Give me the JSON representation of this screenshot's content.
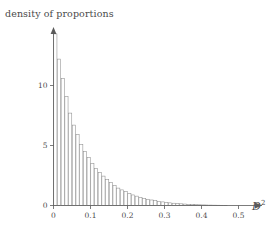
{
  "chart_data": {
    "type": "bar",
    "title": "density of proportions",
    "xlabel": "D²",
    "ylabel": "density of proportions",
    "xlabel_base": "D",
    "xlabel_exponent": "2",
    "xlim": [
      0,
      0.56
    ],
    "ylim": [
      0,
      14.8
    ],
    "grid": false,
    "legend": null,
    "bin_width": 0.01,
    "x_ticks": [
      0,
      0.1,
      0.2,
      0.3,
      0.4,
      0.5
    ],
    "x_tick_labels": [
      "0",
      "0.1",
      "0.2",
      "0.3",
      "0.4",
      "0.5"
    ],
    "y_ticks": [
      0,
      5,
      10
    ],
    "y_tick_labels": [
      "0",
      "5",
      "10"
    ],
    "bar_color": "#ffffff",
    "bar_edge_color": "#8c8c8c",
    "axis_color": "#5a5a5a",
    "categories": [
      "0.000",
      "0.010",
      "0.020",
      "0.030",
      "0.040",
      "0.050",
      "0.060",
      "0.070",
      "0.080",
      "0.090",
      "0.100",
      "0.110",
      "0.120",
      "0.130",
      "0.140",
      "0.150",
      "0.160",
      "0.170",
      "0.180",
      "0.190",
      "0.200",
      "0.210",
      "0.220",
      "0.230",
      "0.240",
      "0.250",
      "0.260",
      "0.270",
      "0.280",
      "0.290",
      "0.300",
      "0.310",
      "0.320",
      "0.330",
      "0.340",
      "0.350",
      "0.360",
      "0.370",
      "0.380",
      "0.390",
      "0.400",
      "0.410",
      "0.420",
      "0.430",
      "0.440",
      "0.450",
      "0.460",
      "0.470",
      "0.480",
      "0.490",
      "0.500",
      "0.510",
      "0.520",
      "0.530"
    ],
    "values": [
      14.3,
      12.2,
      10.6,
      9.1,
      7.7,
      6.7,
      5.9,
      5.1,
      4.5,
      4.0,
      3.5,
      3.1,
      2.75,
      2.45,
      2.15,
      1.9,
      1.65,
      1.45,
      1.3,
      1.15,
      1.0,
      0.88,
      0.78,
      0.68,
      0.6,
      0.52,
      0.46,
      0.4,
      0.35,
      0.3,
      0.26,
      0.22,
      0.19,
      0.165,
      0.14,
      0.12,
      0.1,
      0.085,
      0.07,
      0.06,
      0.05,
      0.042,
      0.035,
      0.028,
      0.023,
      0.019,
      0.015,
      0.012,
      0.009,
      0.007,
      0.005,
      0.004,
      0.003,
      0.002
    ]
  },
  "axes": {
    "y_axis_name": "density-axis",
    "x_axis_name": "d-squared-axis"
  }
}
